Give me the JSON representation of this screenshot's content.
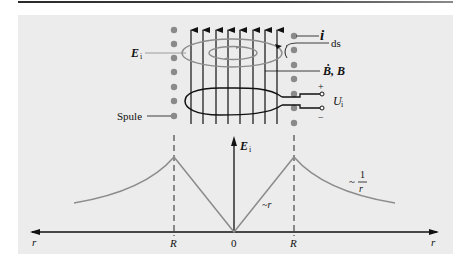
{
  "figure": {
    "top_diagram": {
      "labels": {
        "current": "i",
        "line_element": "ds",
        "field_rate": "Ḃ, B",
        "induced_field": "E",
        "induced_field_sub": "i",
        "voltage": "U",
        "voltage_sub": "i",
        "plus": "+",
        "minus": "−",
        "coil": "Spule"
      }
    },
    "graph": {
      "y_axis_label": "E",
      "y_axis_label_sub": "i",
      "x_axis_left_label": "r",
      "x_axis_right_label": "r",
      "tick_left": "R",
      "tick_center": "0",
      "tick_right": "R",
      "inner_annotation": "~r",
      "outer_annotation_prefix": "~",
      "outer_annotation_num": "1",
      "outer_annotation_den": "r"
    }
  },
  "colors": {
    "panel": "#ececec",
    "ink": "#111111",
    "curve": "#8c8c8c",
    "dots": "#8a8a8a"
  }
}
